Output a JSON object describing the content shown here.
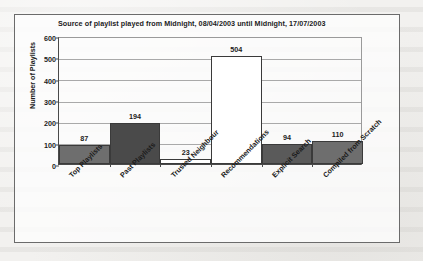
{
  "chart_data": {
    "type": "bar",
    "title": "Source of playlist played from Midnight, 08/04/2003 until Midnight, 17/07/2003",
    "xlabel": "",
    "ylabel": "Number of Playlists",
    "categories": [
      "Top Playlists",
      "Past Playlists",
      "Trusted Neighbour",
      "Recommendations",
      "Explicit Search",
      "Compiled from Scratch"
    ],
    "values": [
      87,
      194,
      23,
      504,
      94,
      110
    ],
    "value_labels": [
      "87",
      "194",
      "23",
      "504",
      "94",
      "110"
    ],
    "bar_colors": [
      "#6e6e6e",
      "#4a4a4a",
      "#ffffff",
      "#ffffff",
      "#5a5a5a",
      "#6e6e6e"
    ],
    "ylim": [
      0,
      600
    ],
    "yticks": [
      0,
      100,
      200,
      300,
      400,
      500,
      600
    ],
    "ytick_labels": [
      "0",
      "100",
      "200",
      "300",
      "400",
      "500",
      "600"
    ],
    "grid": true,
    "legend": "none",
    "legend_position": "none"
  },
  "colors": {
    "axis": "#4a4a4a",
    "gridline": "#a9a9a9",
    "text": "#1b1b1b",
    "frame": "#6b6b6b",
    "plot_background": "#ffffff"
  }
}
